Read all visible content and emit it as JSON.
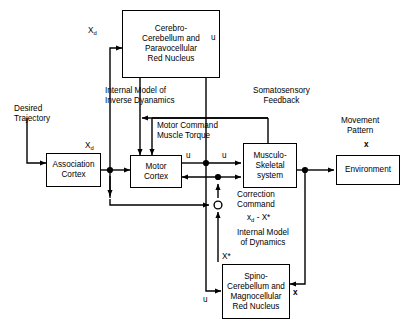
{
  "diagram": {
    "stroke_color": "#000000",
    "background_color": "#ffffff"
  },
  "boxes": {
    "cerebro_cerebellum": "Cerebro-\nCerebellum and\nParavocellular\nRed Nucleus",
    "association_cortex": "Association\nCortex",
    "motor_cortex": "Motor\nCortex",
    "musculo_skeletal": "Musculo-\nSkeletal\nsystem",
    "environment": "Environment",
    "spino_cerebellum": "Spino-\nCerebellum and\nMagnocellular\nRed Nucleus"
  },
  "labels": {
    "xd_top": "X",
    "xd_top_sub": "d",
    "u_top_right": "u",
    "internal_model_inverse": "Internal Model of\nInverse Dyanamics",
    "somatosensory_feedback": "Somatosensory\nFeedback",
    "desired_trajectory": "Desired\nTrajectory",
    "xd_assoc": "X",
    "xd_assoc_sub": "d",
    "motor_command": "Motor Command\nMuscle Torque",
    "movement_pattern": "Movement\nPattern",
    "movement_pattern_var": "x",
    "u_motor_out": "u",
    "u_junction": "u",
    "correction_command": "Correction\nCommand",
    "correction_expr_a": "x",
    "correction_expr_sub": "d",
    "correction_expr_b": " - X*",
    "internal_model_dynamics": "Internal Model\nof Dynamics",
    "x_star": "X*",
    "u_bottom": "u",
    "x_bottom": "x"
  }
}
